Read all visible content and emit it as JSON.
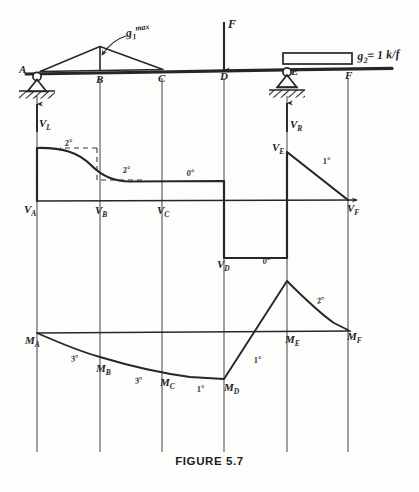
{
  "figure": {
    "caption": "FIGURE 5.7"
  },
  "beam": {
    "stations": [
      {
        "id": "A",
        "label": "A",
        "x": 37
      },
      {
        "id": "B",
        "label": "B",
        "x": 100
      },
      {
        "id": "C",
        "label": "C",
        "x": 162
      },
      {
        "id": "D",
        "label": "D",
        "x": 224
      },
      {
        "id": "E",
        "label": "E",
        "x": 287
      },
      {
        "id": "F",
        "label": "F",
        "x": 348
      }
    ],
    "supports": [
      {
        "id": "A",
        "type": "pin",
        "x": 37,
        "reaction_label": "V",
        "reaction_sub": "L"
      },
      {
        "id": "E",
        "type": "roller",
        "x": 287,
        "reaction_label": "V",
        "reaction_sub": "R"
      }
    ],
    "loads": [
      {
        "id": "g1",
        "type": "triangular",
        "label": "g",
        "sub": "1",
        "sup": "max",
        "from": "A",
        "to": "C",
        "peak_at": "B"
      },
      {
        "id": "F",
        "type": "point",
        "label": "F",
        "at": "D",
        "direction": "down"
      },
      {
        "id": "g2",
        "type": "uniform",
        "label": "g",
        "sub": "2",
        "value_text": "= 1 k/f",
        "from": "E",
        "to": "F"
      }
    ]
  },
  "shear_diagram": {
    "name": "shear",
    "points": [
      {
        "label": "V",
        "sub": "A",
        "x": 37
      },
      {
        "label": "V",
        "sub": "B",
        "x": 100
      },
      {
        "label": "V",
        "sub": "C",
        "x": 162
      },
      {
        "label": "V",
        "sub": "D",
        "x": 224
      },
      {
        "label": "V",
        "sub": "E",
        "x": 287
      },
      {
        "label": "V",
        "sub": "F",
        "x": 348
      }
    ],
    "degree_annotations": [
      {
        "text": "2°",
        "x": 64,
        "y": 139
      },
      {
        "text": "2°",
        "x": 122,
        "y": 166
      },
      {
        "text": "0°",
        "x": 186,
        "y": 169
      },
      {
        "text": "0°",
        "x": 262,
        "y": 257
      },
      {
        "text": "1°",
        "x": 322,
        "y": 157
      }
    ],
    "reaction_arrows": [
      {
        "label": "V",
        "sub": "L",
        "x": 37
      },
      {
        "label": "V",
        "sub": "R",
        "x": 287
      }
    ]
  },
  "moment_diagram": {
    "name": "moment",
    "points": [
      {
        "label": "M",
        "sub": "A",
        "x": 37
      },
      {
        "label": "M",
        "sub": "B",
        "x": 100
      },
      {
        "label": "M",
        "sub": "C",
        "x": 162
      },
      {
        "label": "M",
        "sub": "D",
        "x": 224
      },
      {
        "label": "M",
        "sub": "E",
        "x": 287
      },
      {
        "label": "M",
        "sub": "F",
        "x": 348
      }
    ],
    "degree_annotations": [
      {
        "text": "3°",
        "x": 70,
        "y": 355
      },
      {
        "text": "3°",
        "x": 134,
        "y": 377
      },
      {
        "text": "1°",
        "x": 196,
        "y": 385
      },
      {
        "text": "1°",
        "x": 253,
        "y": 356
      },
      {
        "text": "2°",
        "x": 316,
        "y": 297
      }
    ]
  },
  "colors": {
    "ink": "#25262a",
    "paper": "#fdfdfc",
    "caption": "#1b1c1f"
  }
}
